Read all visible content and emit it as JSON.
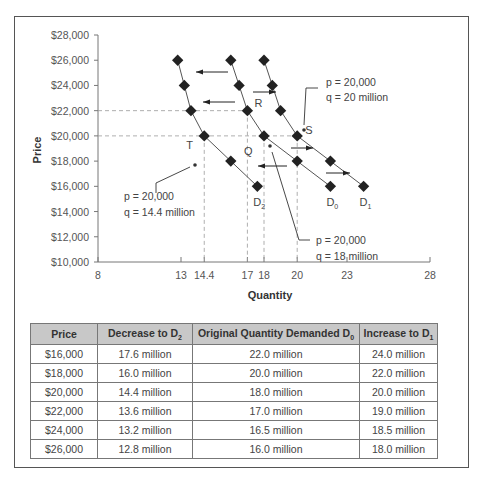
{
  "chart_data": {
    "type": "line",
    "title": "",
    "xlabel": "Quantity",
    "ylabel": "Price",
    "xlim": [
      8,
      28
    ],
    "ylim": [
      10000,
      28000
    ],
    "x_ticks": [
      "8",
      "13",
      "14.4",
      "17",
      "18",
      "20",
      "23",
      "28"
    ],
    "y_ticks": [
      "$10,000",
      "$12,000",
      "$14,000",
      "$16,000",
      "$18,000",
      "$20,000",
      "$22,000",
      "$24,000",
      "$26,000",
      "$28,000"
    ],
    "grid": false,
    "series": [
      {
        "name": "D2",
        "label_main": "D",
        "label_sub": "2",
        "points": [
          [
            12.8,
            26000
          ],
          [
            13.2,
            24000
          ],
          [
            13.6,
            22000
          ],
          [
            14.4,
            20000
          ],
          [
            16.0,
            18000
          ],
          [
            17.6,
            16000
          ]
        ]
      },
      {
        "name": "D0",
        "label_main": "D",
        "label_sub": "0",
        "points": [
          [
            16.0,
            26000
          ],
          [
            16.5,
            24000
          ],
          [
            17.0,
            22000
          ],
          [
            18.0,
            20000
          ],
          [
            20.0,
            18000
          ],
          [
            22.0,
            16000
          ]
        ]
      },
      {
        "name": "D1",
        "label_main": "D",
        "label_sub": "1",
        "points": [
          [
            18.0,
            26000
          ],
          [
            18.5,
            24000
          ],
          [
            19.0,
            22000
          ],
          [
            20.0,
            20000
          ],
          [
            22.0,
            18000
          ],
          [
            24.0,
            16000
          ]
        ]
      }
    ],
    "point_labels": [
      {
        "text": "R",
        "x": 17.0,
        "y": 22000
      },
      {
        "text": "S",
        "x": 20.0,
        "y": 20000
      },
      {
        "text": "Q",
        "x": 18.0,
        "y": 20000
      },
      {
        "text": "T",
        "x": 14.4,
        "y": 20000
      }
    ],
    "annotations": [
      {
        "line1": "p = 20,000",
        "line2": "q = 20 million",
        "target": "S"
      },
      {
        "line1": "p = 20,000",
        "line2": "q = 14.4 million",
        "target": "T"
      },
      {
        "line1": "p = 20,000",
        "line2": "q = 18 million",
        "target": "Q"
      }
    ]
  },
  "table": {
    "headers": {
      "price": "Price",
      "decrease": "Decrease to D",
      "decrease_sub": "2",
      "original": "Original Quantity Demanded D",
      "original_sub": "0",
      "increase": "Increase to D",
      "increase_sub": "1"
    },
    "rows": [
      [
        "$16,000",
        "17.6 million",
        "22.0 million",
        "24.0 million"
      ],
      [
        "$18,000",
        "16.0 million",
        "20.0 million",
        "22.0 million"
      ],
      [
        "$20,000",
        "14.4 million",
        "18.0 million",
        "20.0 million"
      ],
      [
        "$22,000",
        "13.6 million",
        "17.0 million",
        "19.0 million"
      ],
      [
        "$24,000",
        "13.2 million",
        "16.5 million",
        "18.5 million"
      ],
      [
        "$26,000",
        "12.8 million",
        "16.0 million",
        "18.0 million"
      ]
    ]
  }
}
